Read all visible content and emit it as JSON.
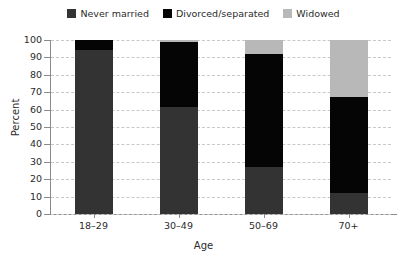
{
  "chart_data": {
    "type": "bar",
    "subtype": "stacked-vertical-100",
    "title": "",
    "xlabel": "Age",
    "ylabel": "Percent",
    "categories": [
      "18–29",
      "30–49",
      "50–69",
      "70+"
    ],
    "series": [
      {
        "name": "Never married",
        "values": [
          94,
          61.5,
          27,
          12
        ],
        "color": "#333333"
      },
      {
        "name": "Divorced/separated",
        "values": [
          6,
          37.5,
          65,
          55
        ],
        "color": "#050505"
      },
      {
        "name": "Widowed",
        "values": [
          0,
          1,
          8,
          33
        ],
        "color": "#b8b8b8"
      }
    ],
    "stack_order_bottom_to_top": [
      "Never married",
      "Divorced/separated",
      "Widowed"
    ],
    "ylim": [
      0,
      100
    ],
    "yticks": [
      0,
      10,
      20,
      30,
      40,
      50,
      60,
      70,
      80,
      90,
      100
    ],
    "ytick_labels": [
      "0",
      "10",
      "20",
      "30",
      "40",
      "50",
      "60",
      "70",
      "80",
      "90",
      "100"
    ],
    "grid": true,
    "grid_axis": "y",
    "grid_style": "dashed",
    "grid_color": "#c8c8c8",
    "legend_position": "top-center",
    "legend_entries": [
      {
        "label": "Never married",
        "color": "#333333"
      },
      {
        "label": "Divorced/separated",
        "color": "#050505"
      },
      {
        "label": "Widowed",
        "color": "#b8b8b8"
      }
    ],
    "axis_color": "#8a8a8a",
    "background": "#ffffff"
  }
}
